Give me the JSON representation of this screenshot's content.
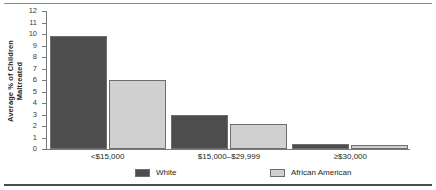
{
  "chart_data": {
    "type": "bar",
    "title": "",
    "xlabel": "",
    "ylabel": "Average % of Children Maltreated",
    "ylabel_line1": "Average % of Children",
    "ylabel_line2": "Maltreated",
    "categories": [
      "<$15,000",
      "$15,000–$29,999",
      "≥30,000"
    ],
    "category_labels": [
      "<$15,000",
      "$15,000–$29,999",
      "≥$30,000"
    ],
    "series": [
      {
        "name": "White",
        "values": [
          9.8,
          3.0,
          0.45
        ],
        "color": "#4d4d4d"
      },
      {
        "name": "African American",
        "values": [
          6.0,
          2.2,
          0.35
        ],
        "color": "#d0d0d0"
      }
    ],
    "ylim": [
      0,
      12
    ],
    "yticks": [
      0,
      1,
      2,
      3,
      4,
      5,
      6,
      7,
      8,
      9,
      10,
      11,
      12
    ],
    "ytick_labels": [
      "0",
      "1",
      "2",
      "3",
      "4",
      "5",
      "6",
      "7",
      "8",
      "9",
      "10",
      "11",
      "12"
    ],
    "grid": false,
    "legend_position": "bottom",
    "legend": [
      {
        "label": "White",
        "color": "#4d4d4d"
      },
      {
        "label": "African American",
        "color": "#d0d0d0"
      }
    ]
  },
  "colors": {
    "white_series": "#4d4d4d",
    "african_american_series": "#d0d0d0",
    "axis": "#7a7a7a",
    "bar_border": "#6e6e6e",
    "rule_top": "#8c8c8c",
    "rule_bottom": "#4d4d4d"
  }
}
